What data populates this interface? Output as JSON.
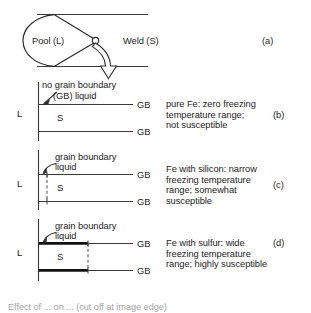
{
  "figure": {
    "title_alt": "Weld pool solidification and grain boundary liquid susceptibility",
    "ink_color": "#1d1d1d",
    "line_color": "#3a3a3a",
    "thick_line_color": "#111111",
    "background": "#ffffff"
  },
  "panel_a": {
    "tag": "(a)",
    "pool_label": "Pool (L)",
    "weld_label": "Weld (S)"
  },
  "panel_b": {
    "tag": "(b)",
    "liquid_label_line1": "no grain boundary",
    "liquid_label_line2": "(GB) liquid",
    "left_phase": "L",
    "center_phase": "S",
    "gb_top": "GB",
    "gb_bottom": "GB",
    "description_line1": "pure Fe: zero freezing",
    "description_line2": "temperature range;",
    "description_line3": "not susceptible"
  },
  "panel_c": {
    "tag": "(c)",
    "liquid_label_line1": "grain boundary",
    "liquid_label_line2": "liquid",
    "left_phase": "L",
    "center_phase": "S",
    "gb_top": "GB",
    "gb_bottom": "GB",
    "description_line1": "Fe with silicon: narrow",
    "description_line2": "freezing temperature",
    "description_line3": "range; somewhat",
    "description_line4": "susceptible"
  },
  "panel_d": {
    "tag": "(d)",
    "liquid_label_line1": "grain boundary",
    "liquid_label_line2": "liquid",
    "left_phase": "L",
    "center_phase": "S",
    "gb_top": "GB",
    "gb_bottom": "GB",
    "description_line1": "Fe with sulfur: wide",
    "description_line2": "freezing temperature",
    "description_line3": "range; highly susceptible"
  },
  "caption": {
    "text": "Effect of ... on ... (cut off at image edge)"
  }
}
